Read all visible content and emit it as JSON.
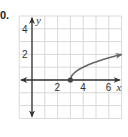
{
  "problem": {
    "number": "0."
  },
  "chart_data": {
    "type": "line",
    "title": "",
    "xlabel": "x",
    "ylabel": "y",
    "xlim": [
      -1,
      7
    ],
    "ylim": [
      -3,
      5
    ],
    "grid": true,
    "x_tick_labels": [
      "2",
      "4",
      "6"
    ],
    "y_tick_labels": [
      "4",
      "2"
    ],
    "series": [
      {
        "name": "y = sqrt(x - 3)",
        "start_point": {
          "x": 3,
          "y": 0,
          "marker": "closed-dot"
        },
        "end_arrow": true,
        "x": [
          3,
          3.25,
          3.5,
          4,
          4.5,
          5,
          5.5,
          6,
          6.5,
          7
        ],
        "values": [
          0,
          0.5,
          0.71,
          1,
          1.22,
          1.41,
          1.58,
          1.73,
          1.87,
          2
        ]
      }
    ],
    "colors": {
      "curve": "#666666",
      "axes": "#333333",
      "grid": "#d9d9d9"
    }
  }
}
